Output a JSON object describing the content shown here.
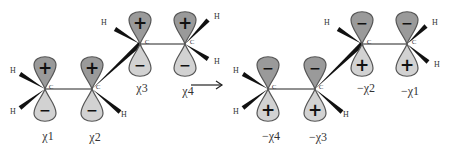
{
  "diagram": {
    "type": "molecular orbital / basis function transformation",
    "colors": {
      "upper_lobe": "#9a9a9a",
      "lower_lobe": "#d2d2d2",
      "outline": "#555555",
      "bond": "#222222"
    },
    "left_molecule": {
      "carbons": [
        {
          "id": "C1",
          "label": "C",
          "x": 45,
          "y": 89,
          "top_sign": "+",
          "bottom_sign": "-",
          "orbital_label": "χ1",
          "label_x": 48,
          "label_y": 136
        },
        {
          "id": "C2",
          "label": "C",
          "x": 92,
          "y": 89,
          "top_sign": "+",
          "bottom_sign": "-",
          "orbital_label": "χ2",
          "label_x": 95,
          "label_y": 137
        },
        {
          "id": "C3",
          "label": "C",
          "x": 140,
          "y": 44,
          "top_sign": "+",
          "bottom_sign": "-",
          "orbital_label": "χ3",
          "label_x": 142,
          "label_y": 88
        },
        {
          "id": "C4",
          "label": "C",
          "x": 185,
          "y": 44,
          "top_sign": "+",
          "bottom_sign": "-",
          "orbital_label": "χ4",
          "label_x": 188,
          "label_y": 91
        }
      ],
      "hydrogens": [
        {
          "label": "H",
          "x": 13,
          "y": 70
        },
        {
          "label": "H",
          "x": 13,
          "y": 111
        },
        {
          "label": "H",
          "x": 124,
          "y": 114
        },
        {
          "label": "H",
          "x": 104,
          "y": 22
        },
        {
          "label": "H",
          "x": 217,
          "y": 16
        },
        {
          "label": "H",
          "x": 217,
          "y": 61
        }
      ]
    },
    "arrow": {
      "from_x": 191,
      "to_x": 222,
      "y": 85
    },
    "right_molecule": {
      "carbons": [
        {
          "id": "C1",
          "label": "C",
          "x": 268,
          "y": 89,
          "top_sign": "-",
          "bottom_sign": "+",
          "orbital_label": "−χ4",
          "label_x": 271,
          "label_y": 136
        },
        {
          "id": "C2",
          "label": "C",
          "x": 315,
          "y": 89,
          "top_sign": "-",
          "bottom_sign": "+",
          "orbital_label": "−χ3",
          "label_x": 318,
          "label_y": 137
        },
        {
          "id": "C3",
          "label": "C",
          "x": 362,
          "y": 44,
          "top_sign": "-",
          "bottom_sign": "+",
          "orbital_label": "−χ2",
          "label_x": 366,
          "label_y": 88
        },
        {
          "id": "C4",
          "label": "C",
          "x": 407,
          "y": 44,
          "top_sign": "-",
          "bottom_sign": "+",
          "orbital_label": "−χ1",
          "label_x": 410,
          "label_y": 91
        }
      ],
      "hydrogens": [
        {
          "label": "H",
          "x": 236,
          "y": 70
        },
        {
          "label": "H",
          "x": 236,
          "y": 111
        },
        {
          "label": "H",
          "x": 346,
          "y": 114
        },
        {
          "label": "H",
          "x": 327,
          "y": 22
        },
        {
          "label": "H",
          "x": 435,
          "y": 22
        },
        {
          "label": "H",
          "x": 437,
          "y": 64
        }
      ]
    }
  }
}
